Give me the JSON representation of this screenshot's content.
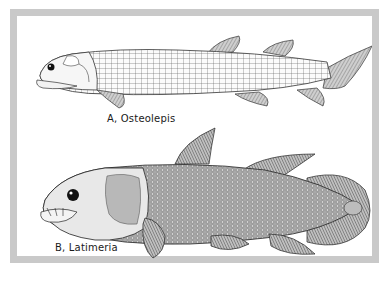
{
  "figure": {
    "frame_color": "#c9c9c9",
    "panel_color": "#ffffff",
    "ink_color": "#2a2a2a",
    "illustrations": [
      {
        "id": "A",
        "caption": "A,  Osteolepis",
        "subject": "osteolepis-fish"
      },
      {
        "id": "B",
        "caption": "B,  Latimeria",
        "subject": "latimeria-coelacanth"
      }
    ]
  }
}
